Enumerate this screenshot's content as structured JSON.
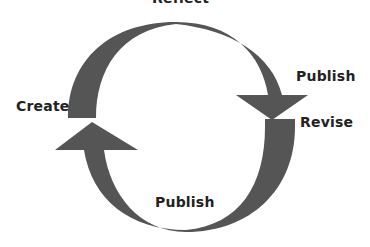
{
  "diagram": {
    "type": "cycle",
    "arrow_color": "#555555",
    "labels": {
      "reflect": "Reflect",
      "publish_top": "Publish",
      "revise": "Revise",
      "create": "Create",
      "publish_bottom": "Publish"
    }
  }
}
